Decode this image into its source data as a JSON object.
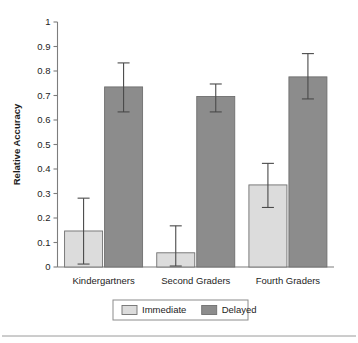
{
  "chart_data": {
    "type": "bar",
    "title": "",
    "xlabel": "",
    "ylabel": "Relative Accuracy",
    "ylim": [
      0,
      1
    ],
    "ytick_labels": [
      "0",
      "0.1",
      "0.2",
      "0.3",
      "0.4",
      "0.5",
      "0.6",
      "0.7",
      "0.8",
      "0.9",
      "1"
    ],
    "ytick_values": [
      0,
      0.1,
      0.2,
      0.3,
      0.4,
      0.5,
      0.6,
      0.7,
      0.8,
      0.9,
      1
    ],
    "grid": false,
    "legend_position": "bottom-center",
    "categories": [
      "Kindergartners",
      "Second Graders",
      "Fourth Graders"
    ],
    "series": [
      {
        "name": "Immediate",
        "color": "#dcdcdc",
        "values": [
          0.147,
          0.058,
          0.335
        ],
        "error_upper": [
          0.281,
          0.168,
          0.423
        ],
        "error_lower": [
          0.012,
          0.004,
          0.243
        ]
      },
      {
        "name": "Delayed",
        "color": "#8c8c8c",
        "values": [
          0.735,
          0.696,
          0.776
        ],
        "error_upper": [
          0.833,
          0.747,
          0.871
        ],
        "error_lower": [
          0.633,
          0.633,
          0.686
        ]
      }
    ]
  },
  "legend": {
    "items": [
      {
        "label": "Immediate",
        "color": "#dcdcdc"
      },
      {
        "label": "Delayed",
        "color": "#8c8c8c"
      }
    ]
  },
  "axis": {
    "y_title": "Relative Accuracy"
  }
}
